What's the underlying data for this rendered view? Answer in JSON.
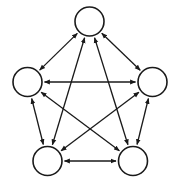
{
  "diagram": {
    "type": "complete-graph",
    "directed": "bidirectional",
    "stroke_color": "#1a1a1a",
    "fill_color": "#ffffff",
    "node_radius": 14.5,
    "nodes": [
      {
        "id": "top",
        "label": "",
        "x": 89.5,
        "y": 21.5
      },
      {
        "id": "left",
        "label": "",
        "x": 27.5,
        "y": 82
      },
      {
        "id": "right",
        "label": "",
        "x": 152.5,
        "y": 82
      },
      {
        "id": "bottom-left",
        "label": "",
        "x": 47.5,
        "y": 161
      },
      {
        "id": "bottom-right",
        "label": "",
        "x": 133,
        "y": 161
      }
    ],
    "edges": [
      {
        "from": "top",
        "to": "left"
      },
      {
        "from": "top",
        "to": "right"
      },
      {
        "from": "top",
        "to": "bottom-left"
      },
      {
        "from": "top",
        "to": "bottom-right"
      },
      {
        "from": "left",
        "to": "right"
      },
      {
        "from": "left",
        "to": "bottom-left"
      },
      {
        "from": "left",
        "to": "bottom-right"
      },
      {
        "from": "right",
        "to": "bottom-left"
      },
      {
        "from": "right",
        "to": "bottom-right"
      },
      {
        "from": "bottom-left",
        "to": "bottom-right"
      }
    ]
  }
}
